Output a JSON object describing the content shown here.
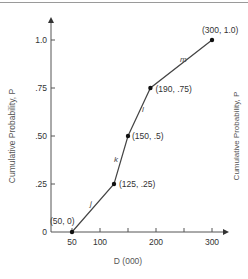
{
  "chart_data": {
    "type": "line",
    "title": "",
    "xlabel": "D (000)",
    "ylabel": "Cumulative Probability, P",
    "ylabel_right": "Cumulative Probability, P",
    "xlim": [
      0,
      320
    ],
    "ylim": [
      0,
      1.1
    ],
    "x_ticks": [
      50,
      100,
      150,
      200,
      250,
      300
    ],
    "x_tick_labels": [
      "50",
      "100",
      "",
      "200",
      "",
      "300"
    ],
    "y_ticks": [
      0,
      0.25,
      0.5,
      0.75,
      1.0
    ],
    "y_tick_labels": [
      "0",
      ".25",
      ".50",
      ".75",
      "1.0"
    ],
    "grid": false,
    "series": [
      {
        "name": "Cumulative distribution",
        "x": [
          50,
          125,
          150,
          190,
          300
        ],
        "y": [
          0,
          0.25,
          0.5,
          0.75,
          1.0
        ]
      }
    ],
    "point_labels": [
      "(50, 0)",
      "(125, .25)",
      "(150, .5)",
      "(190, .75)",
      "(300, 1.0)"
    ],
    "segment_labels": [
      "j",
      "k",
      "l",
      "m"
    ]
  }
}
